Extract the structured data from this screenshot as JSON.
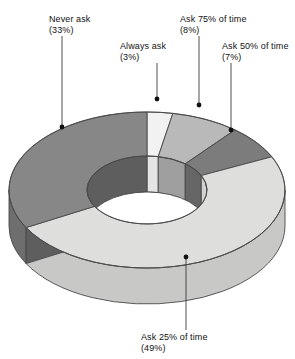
{
  "chart_data": {
    "type": "pie",
    "variant": "doughnut-3d",
    "title": "",
    "subtitle": "",
    "xlabel": "",
    "ylabel": "",
    "legend_position": "none",
    "grid": false,
    "labels_outside": true,
    "units": "%",
    "total": 100,
    "categories": [
      "Always ask",
      "Ask 75% of time",
      "Ask 50% of time",
      "Ask 25% of time",
      "Never ask"
    ],
    "values": [
      3,
      8,
      7,
      49,
      33
    ],
    "slices": [
      {
        "name": "Always ask",
        "value": 3,
        "value_text": "(3%)",
        "color": "#f2f2f2",
        "side_color": "#dcdcdc",
        "inner_color": "#e4e4e4",
        "start_pct": 0,
        "end_pct": 3
      },
      {
        "name": "Ask 75% of time",
        "value": 8,
        "value_text": "(8%)",
        "color": "#b9b9b9",
        "side_color": "#a4a4a4",
        "inner_color": "#9f9f9f",
        "start_pct": 3,
        "end_pct": 11
      },
      {
        "name": "Ask 50% of time",
        "value": 7,
        "value_text": "(7%)",
        "color": "#7c7c7c",
        "side_color": "#6a6a6a",
        "inner_color": "#666666",
        "start_pct": 11,
        "end_pct": 18
      },
      {
        "name": "Ask 25% of time",
        "value": 49,
        "value_text": "(49%)",
        "color": "#dededc",
        "side_color": "#c8c8c6",
        "inner_color": "#d2d2d0",
        "start_pct": 18,
        "end_pct": 67
      },
      {
        "name": "Never ask",
        "value": 33,
        "value_text": "(33%)",
        "color": "#878787",
        "side_color": "#6e6e6e",
        "inner_color": "#5e5e5e",
        "start_pct": 67,
        "end_pct": 100
      }
    ],
    "annotations": [
      {
        "id": "never-ask",
        "line1": "Never ask",
        "line2": "(33%)",
        "label_x": 49,
        "label_y": 14,
        "leader_x": 62,
        "leader_y1": 36,
        "leader_y2": 126,
        "dot_x": 62,
        "dot_y": 127
      },
      {
        "id": "always-ask",
        "line1": "Always ask",
        "line2": "(3%)",
        "label_x": 120,
        "label_y": 41,
        "leader_x": 157,
        "leader_y1": 63,
        "leader_y2": 98,
        "dot_x": 157,
        "dot_y": 99
      },
      {
        "id": "ask-75",
        "line1": "Ask 75% of time",
        "line2": "(8%)",
        "label_x": 180,
        "label_y": 14,
        "leader_x": 199,
        "leader_y1": 36,
        "leader_y2": 104,
        "dot_x": 199,
        "dot_y": 105
      },
      {
        "id": "ask-50",
        "line1": "Ask 50% of time",
        "line2": "(7%)",
        "label_x": 222,
        "label_y": 41,
        "leader_x": 231,
        "leader_y1": 63,
        "leader_y2": 129,
        "dot_x": 231,
        "dot_y": 130
      },
      {
        "id": "ask-25",
        "line1": "Ask 25% of time",
        "line2": "(49%)",
        "label_x": 141,
        "label_y": 332,
        "leader_x": 186,
        "leader_y1": 258,
        "leader_y2": 330,
        "dot_x": 186,
        "dot_y": 257
      }
    ],
    "geometry": {
      "center_x": 147,
      "center_y": 190,
      "outer_rx": 138,
      "outer_ry": 78,
      "inner_rx": 60,
      "inner_ry": 34,
      "depth": 36,
      "rotation_deg": -90,
      "outline_color": "#4a4a4a",
      "hole_color": "#ffffff"
    }
  }
}
